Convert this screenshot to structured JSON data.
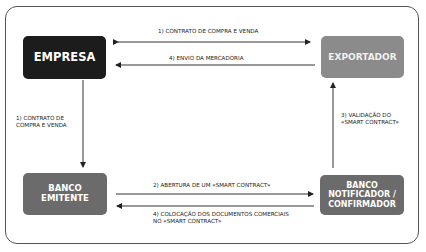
{
  "diagram": {
    "nodes": {
      "empresa": {
        "label": "EMPRESA",
        "color": "#1c1c1c"
      },
      "exportador": {
        "label": "EXPORTADOR",
        "color": "#8b8b8b"
      },
      "banco_emitente": {
        "line1": "BANCO",
        "line2": "EMITENTE",
        "color": "#6b6b6b"
      },
      "banco_notificador": {
        "line1": "BANCO",
        "line2": "NOTIFICADOR /",
        "line3": "CONFIRMADOR",
        "color": "#6b6b6b"
      }
    },
    "edges": {
      "e1_top": {
        "label": "1) CONTRATO DE COMPRA E VENDA",
        "from": "EMPRESA",
        "to": "EXPORTADOR",
        "direction": "bidirectional"
      },
      "e4_top": {
        "label": "4) ENVIO DA MERCADORIA",
        "from": "EXPORTADOR",
        "to": "EMPRESA"
      },
      "e1_left": {
        "line1": "1)  CONTRATO DE",
        "line2": "COMPRA E VENDA",
        "from": "EMPRESA",
        "to": "BANCO EMITENTE"
      },
      "e3_right": {
        "line1": "3) VALIDAÇÃO DO",
        "line2": "«SMART CONTRACT»",
        "from": "BANCO NOTIFICADOR / CONFIRMADOR",
        "to": "EXPORTADOR"
      },
      "e2_bottom": {
        "label": "2) ABERTURA DE UM «SMART CONTRACT»",
        "from": "BANCO EMITENTE",
        "to": "BANCO NOTIFICADOR / CONFIRMADOR"
      },
      "e4_bottom": {
        "line1": "4) COLOCAÇÃO DOS DOCUMENTOS COMERCIAIS",
        "line2": "NO «SMART CONTRACT»",
        "from": "BANCO NOTIFICADOR / CONFIRMADOR",
        "to": "BANCO EMITENTE"
      }
    }
  }
}
